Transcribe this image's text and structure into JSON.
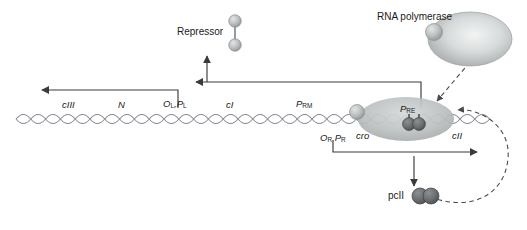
{
  "diagram": {
    "type": "biology-schematic",
    "colors": {
      "line": "#3a3a3a",
      "helix": "#8a8a93",
      "ellipse_fill": "#b9bcbd",
      "sphere_fill": "#b0b3b4",
      "dimer_fill": "#6f7173",
      "polymerase_fill": "#cfd2d2",
      "dashed": "#4a4a4a",
      "text": "#1a1a1a",
      "background": "#ffffff"
    },
    "gene_labels": [
      {
        "id": "cIII",
        "text": "cIII",
        "x": 62,
        "y": 100
      },
      {
        "id": "N",
        "text": "N",
        "x": 118,
        "y": 100
      },
      {
        "id": "cI",
        "text": "cI",
        "x": 226,
        "y": 100
      },
      {
        "id": "cro",
        "text": "cro",
        "x": 356,
        "y": 131
      },
      {
        "id": "cII",
        "text": "cII",
        "x": 452,
        "y": 131
      }
    ],
    "operator_labels": [
      {
        "id": "OL-PL",
        "main": "O",
        "sub1": "L",
        "sep": ",",
        "main2": "P",
        "sub2": "L",
        "x": 168,
        "y": 100
      },
      {
        "id": "PRM",
        "main": "P",
        "sub1": "RM",
        "x": 300,
        "y": 100
      },
      {
        "id": "OR-PR",
        "main": "O",
        "sub1": "R",
        "sep": " ",
        "main2": "P",
        "sub2": "R",
        "x": 326,
        "y": 135
      },
      {
        "id": "PRE",
        "main": "P",
        "sub1": "RE",
        "x": 404,
        "y": 108
      }
    ],
    "protein_labels": [
      {
        "id": "repressor",
        "text": "Repressor",
        "x": 177,
        "y": 28
      },
      {
        "id": "rna-polymerase",
        "text": "RNA polymerase",
        "x": 377,
        "y": 13
      },
      {
        "id": "pcII",
        "text": "pcII",
        "x": 398,
        "y": 196
      }
    ]
  }
}
